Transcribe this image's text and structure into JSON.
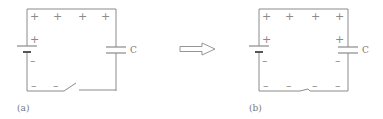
{
  "panels": [
    {
      "id": "a",
      "label": "(a)",
      "capacitor_label": "C",
      "switch_state": "open",
      "top_charges": [
        "+",
        "+",
        "+",
        "+"
      ],
      "battery_top_charge": "+",
      "battery_bottom_charge": "–",
      "bottom_charges": [
        "–",
        "–"
      ]
    },
    {
      "id": "b",
      "label": "(b)",
      "capacitor_label": "C",
      "switch_state": "closed",
      "top_charges": [
        "+",
        "+",
        "+",
        "+"
      ],
      "battery_top_charge": "+",
      "battery_bottom_charge": "–",
      "capacitor_top_charge": "+",
      "capacitor_bottom_charge": "–",
      "bottom_charges": [
        "–",
        "–",
        "–",
        "–"
      ]
    }
  ],
  "arrow": {
    "direction": "right",
    "meaning": "transition-a-to-b"
  },
  "colors": {
    "line": "#8a8a8a",
    "text": "#777777",
    "background": "#ffffff"
  }
}
